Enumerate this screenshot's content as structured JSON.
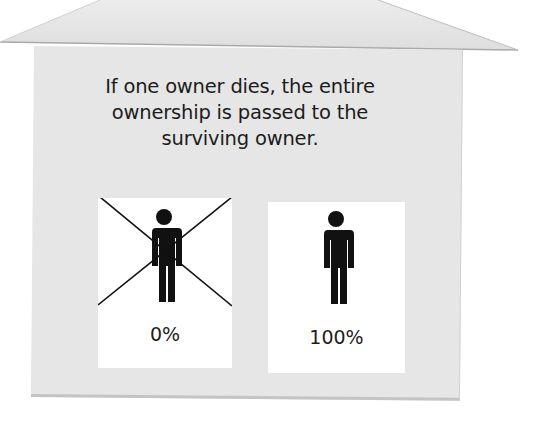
{
  "diagram": {
    "caption_lines": [
      "If one owner dies, the entire",
      "ownership is passed to the",
      "surviving owner."
    ],
    "owners": [
      {
        "label": "0%",
        "status": "deceased",
        "icon": "person-crossed-out-icon"
      },
      {
        "label": "100%",
        "status": "surviving",
        "icon": "person-icon"
      }
    ],
    "colors": {
      "house_fill": "#e6e6e6",
      "roof_fill": "#e4e4e4",
      "card_fill": "#ffffff",
      "figure": "#111111",
      "text": "#1c1c1c"
    }
  }
}
